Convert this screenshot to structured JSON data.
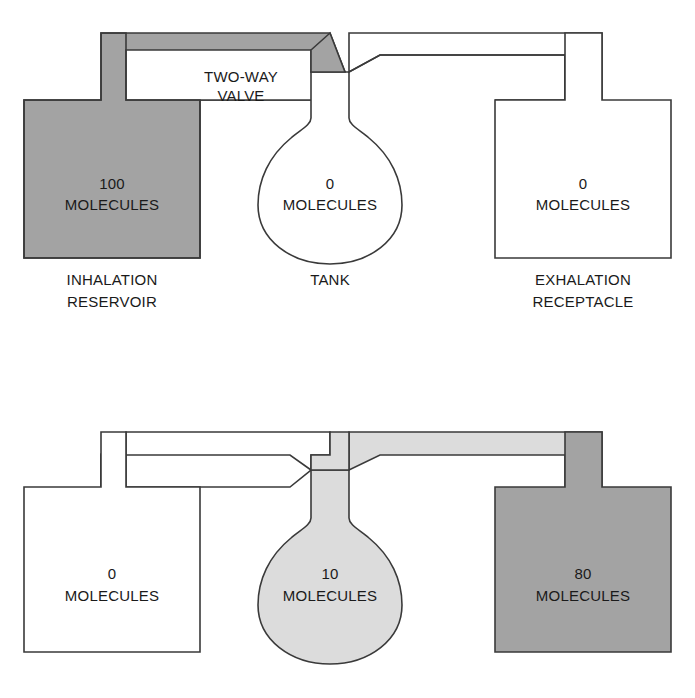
{
  "diagram": {
    "colors": {
      "gas_dark": "#a3a3a3",
      "gas_light": "#dcdcdc",
      "empty": "#ffffff",
      "outline": "#3a3a3a",
      "text": "#1a1a1a"
    },
    "units_label": "MOLECULES",
    "panels": [
      {
        "id": "panel-inhalation",
        "name": "inhalation-phase",
        "annotation": {
          "line1": "TWO-WAY",
          "line2": "VALVE"
        },
        "vessels": [
          {
            "id": "inhalation-reservoir",
            "role": "reservoir",
            "count": "100",
            "units": "MOLECULES",
            "caption_line1": "INHALATION",
            "caption_line2": "RESERVOIR",
            "fill": "dark"
          },
          {
            "id": "tank",
            "role": "tank",
            "count": "0",
            "units": "MOLECULES",
            "caption_line1": "TANK",
            "caption_line2": "",
            "fill": "white"
          },
          {
            "id": "exhalation-receptacle",
            "role": "receptacle",
            "count": "0",
            "units": "MOLECULES",
            "caption_line1": "EXHALATION",
            "caption_line2": "RECEPTACLE",
            "fill": "white"
          }
        ]
      },
      {
        "id": "panel-exhalation",
        "name": "exhalation-phase",
        "annotation": {
          "line1": "",
          "line2": ""
        },
        "vessels": [
          {
            "id": "inhalation-reservoir-2",
            "role": "reservoir",
            "count": "0",
            "units": "MOLECULES",
            "caption_line1": "",
            "caption_line2": "",
            "fill": "white"
          },
          {
            "id": "tank-2",
            "role": "tank",
            "count": "10",
            "units": "MOLECULES",
            "caption_line1": "",
            "caption_line2": "",
            "fill": "light"
          },
          {
            "id": "exhalation-receptacle-2",
            "role": "receptacle",
            "count": "80",
            "units": "MOLECULES",
            "caption_line1": "",
            "caption_line2": "",
            "fill": "dark"
          }
        ]
      }
    ]
  }
}
